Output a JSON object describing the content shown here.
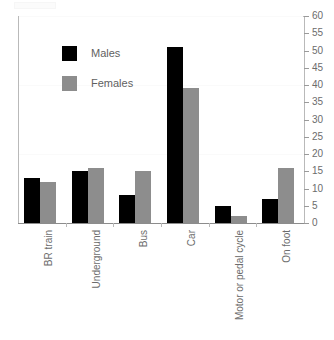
{
  "chart_data": {
    "type": "bar",
    "title": "",
    "subtitle": "",
    "xlabel": "",
    "ylabel": "",
    "categories": [
      "BR train",
      "Underground",
      "Bus",
      "Car",
      "Motor or pedal cycle",
      "On foot"
    ],
    "series": [
      {
        "name": "Males",
        "color": "#000000",
        "values": [
          13,
          15,
          8,
          51,
          5,
          7
        ]
      },
      {
        "name": "Females",
        "color": "#8d8d8d",
        "values": [
          12,
          16,
          15,
          39,
          2,
          16
        ]
      }
    ],
    "ylim": [
      0,
      60
    ],
    "ytick_step": 5,
    "ytick_labels": [
      "0",
      "5",
      "10",
      "15",
      "20",
      "25",
      "30",
      "35",
      "40",
      "45",
      "50",
      "55",
      "60"
    ],
    "yaxis_position": "right",
    "grid": false,
    "legend": {
      "position": "upper-left",
      "entries": [
        "Males",
        "Females"
      ]
    },
    "xtick_label_rotation": -90
  },
  "legend": {
    "males_label": "Males",
    "females_label": "Females"
  },
  "axis": {
    "y_labels": [
      "60",
      "55",
      "50",
      "45",
      "40",
      "35",
      "30",
      "25",
      "20",
      "15",
      "10",
      "5",
      "0"
    ],
    "x_labels": [
      "BR train",
      "Underground",
      "Bus",
      "Car",
      "Motor or pedal cycle",
      "On foot"
    ]
  }
}
